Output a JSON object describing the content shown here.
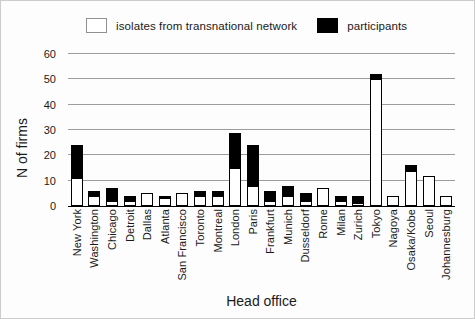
{
  "chart_data": {
    "type": "bar",
    "stacked": true,
    "title": "",
    "xlabel": "Head office",
    "ylabel": "N of firms",
    "ylim": [
      0,
      60
    ],
    "yticks": [
      0,
      10,
      20,
      30,
      40,
      50,
      60
    ],
    "grid": "horizontal",
    "legend_position": "top",
    "categories": [
      "New York",
      "Washington",
      "Chicago",
      "Detroit",
      "Dallas",
      "Atlanta",
      "San Francisco",
      "Toronto",
      "Montreal",
      "London",
      "Paris",
      "Frankfurt",
      "Munich",
      "Dusseldorf",
      "Rome",
      "Milan",
      "Zurich",
      "Tokyo",
      "Nagoya",
      "Osaka/Kobe",
      "Seoul",
      "Johannesburg"
    ],
    "series": [
      {
        "name": "isolates from transnational network",
        "color": "#ffffff",
        "values": [
          11,
          4,
          2,
          2,
          5,
          3,
          5,
          4,
          4,
          15,
          8,
          2,
          4,
          2,
          7,
          2,
          1,
          50,
          4,
          14,
          12,
          4
        ]
      },
      {
        "name": "participants",
        "color": "#000000",
        "values": [
          13,
          2,
          5,
          2,
          0,
          1,
          0,
          2,
          2,
          14,
          16,
          4,
          4,
          3,
          0,
          2,
          3,
          2,
          0,
          2,
          0,
          0
        ]
      }
    ]
  },
  "colors": {
    "background": "#fdfdfd",
    "gridline": "#9c9c9c",
    "axis": "#000000",
    "text": "#1a1a1a"
  }
}
